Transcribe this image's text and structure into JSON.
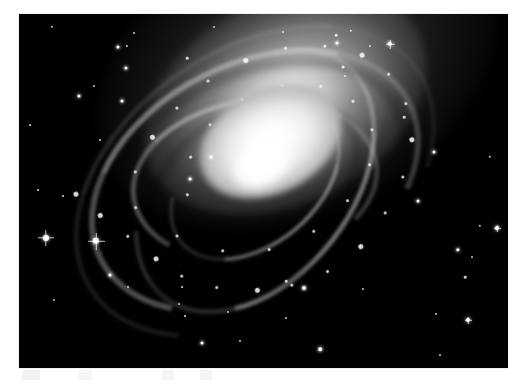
{
  "figure": {
    "kind": "astronomical-photograph",
    "color_mode": "grayscale",
    "caption": "",
    "page_background": "#ffffff",
    "plate_background": "#000000",
    "border_color": "#f2f2f2",
    "plate": {
      "x": 19,
      "y": 14,
      "width": 489,
      "height": 354
    }
  },
  "galaxy": {
    "name": "",
    "center": {
      "x": 255,
      "y": 181
    },
    "position_angle_deg": -27,
    "core_color": "#ffffff",
    "halo_color": "#9a9a9a",
    "arm_count": 4,
    "knots": [
      {
        "x": 62,
        "y": 88,
        "size": "big"
      },
      {
        "x": 74,
        "y": 118,
        "size": "big"
      },
      {
        "x": 90,
        "y": 150,
        "size": "small"
      },
      {
        "x": 104,
        "y": 182,
        "size": "big"
      },
      {
        "x": 120,
        "y": 210,
        "size": "small"
      },
      {
        "x": 146,
        "y": 236,
        "size": "small"
      },
      {
        "x": 180,
        "y": 256,
        "size": "big"
      },
      {
        "x": 214,
        "y": 268,
        "size": "small"
      },
      {
        "x": 252,
        "y": 272,
        "size": "small"
      },
      {
        "x": 292,
        "y": 264,
        "size": "big"
      },
      {
        "x": 330,
        "y": 246,
        "size": "small"
      },
      {
        "x": 362,
        "y": 222,
        "size": "small"
      },
      {
        "x": 386,
        "y": 192,
        "size": "big"
      },
      {
        "x": 398,
        "y": 158,
        "size": "small"
      },
      {
        "x": 396,
        "y": 124,
        "size": "small"
      },
      {
        "x": 380,
        "y": 94,
        "size": "big"
      },
      {
        "x": 352,
        "y": 70,
        "size": "small"
      },
      {
        "x": 316,
        "y": 54,
        "size": "small"
      },
      {
        "x": 274,
        "y": 46,
        "size": "big"
      },
      {
        "x": 232,
        "y": 48,
        "size": "small"
      },
      {
        "x": 192,
        "y": 58,
        "size": "small"
      },
      {
        "x": 156,
        "y": 72,
        "size": "big"
      },
      {
        "x": 126,
        "y": 96,
        "size": "small"
      },
      {
        "x": 110,
        "y": 128,
        "size": "small"
      },
      {
        "x": 134,
        "y": 172,
        "size": "small"
      },
      {
        "x": 168,
        "y": 206,
        "size": "small"
      },
      {
        "x": 210,
        "y": 226,
        "size": "small"
      },
      {
        "x": 258,
        "y": 230,
        "size": "small"
      },
      {
        "x": 302,
        "y": 218,
        "size": "small"
      },
      {
        "x": 338,
        "y": 196,
        "size": "small"
      },
      {
        "x": 356,
        "y": 166,
        "size": "small"
      },
      {
        "x": 352,
        "y": 132,
        "size": "small"
      },
      {
        "x": 330,
        "y": 104,
        "size": "small"
      },
      {
        "x": 296,
        "y": 86,
        "size": "small"
      },
      {
        "x": 254,
        "y": 80,
        "size": "small"
      },
      {
        "x": 214,
        "y": 88,
        "size": "small"
      },
      {
        "x": 182,
        "y": 108,
        "size": "small"
      },
      {
        "x": 162,
        "y": 140,
        "size": "small"
      }
    ]
  },
  "field_stars": [
    {
      "x": 52,
      "y": 27,
      "r": 1.2,
      "bright": false,
      "spike": 0
    },
    {
      "x": 134,
      "y": 33,
      "r": 1.0,
      "bright": false,
      "spike": 0
    },
    {
      "x": 118,
      "y": 47,
      "r": 1.6,
      "bright": true,
      "spike": 0
    },
    {
      "x": 127,
      "y": 46,
      "r": 1.1,
      "bright": false,
      "spike": 0
    },
    {
      "x": 126,
      "y": 68,
      "r": 1.6,
      "bright": true,
      "spike": 0
    },
    {
      "x": 94,
      "y": 86,
      "r": 1.1,
      "bright": false,
      "spike": 0
    },
    {
      "x": 79,
      "y": 96,
      "r": 1.5,
      "bright": true,
      "spike": 0
    },
    {
      "x": 122,
      "y": 101,
      "r": 1.5,
      "bright": true,
      "spike": 0
    },
    {
      "x": 187,
      "y": 58,
      "r": 1.3,
      "bright": false,
      "spike": 0
    },
    {
      "x": 214,
      "y": 27,
      "r": 1.0,
      "bright": false,
      "spike": 0
    },
    {
      "x": 283,
      "y": 32,
      "r": 1.1,
      "bright": false,
      "spike": 0
    },
    {
      "x": 336,
      "y": 35,
      "r": 1.3,
      "bright": false,
      "spike": 0
    },
    {
      "x": 351,
      "y": 31,
      "r": 1.2,
      "bright": false,
      "spike": 0
    },
    {
      "x": 337,
      "y": 43,
      "r": 1.6,
      "bright": true,
      "spike": 0
    },
    {
      "x": 370,
      "y": 46,
      "r": 1.1,
      "bright": false,
      "spike": 0
    },
    {
      "x": 390,
      "y": 44,
      "r": 2.2,
      "bright": true,
      "spike": 9
    },
    {
      "x": 343,
      "y": 67,
      "r": 1.4,
      "bright": false,
      "spike": 0
    },
    {
      "x": 345,
      "y": 76,
      "r": 1.0,
      "bright": false,
      "spike": 0
    },
    {
      "x": 100,
      "y": 140,
      "r": 1.0,
      "bright": false,
      "spike": 0
    },
    {
      "x": 434,
      "y": 152,
      "r": 1.5,
      "bright": true,
      "spike": 0
    },
    {
      "x": 490,
      "y": 157,
      "r": 1.2,
      "bright": false,
      "spike": 0
    },
    {
      "x": 480,
      "y": 226,
      "r": 1.2,
      "bright": false,
      "spike": 0
    },
    {
      "x": 497,
      "y": 228,
      "r": 1.9,
      "bright": true,
      "spike": 7
    },
    {
      "x": 458,
      "y": 250,
      "r": 1.7,
      "bright": true,
      "spike": 0
    },
    {
      "x": 472,
      "y": 257,
      "r": 1.0,
      "bright": false,
      "spike": 0
    },
    {
      "x": 465,
      "y": 277,
      "r": 1.3,
      "bright": false,
      "spike": 0
    },
    {
      "x": 46,
      "y": 238,
      "r": 3.0,
      "bright": true,
      "spike": 16
    },
    {
      "x": 96,
      "y": 241,
      "r": 3.2,
      "bright": true,
      "spike": 17
    },
    {
      "x": 110,
      "y": 275,
      "r": 1.5,
      "bright": true,
      "spike": 0
    },
    {
      "x": 54,
      "y": 300,
      "r": 1.1,
      "bright": false,
      "spike": 0
    },
    {
      "x": 128,
      "y": 287,
      "r": 1.0,
      "bright": false,
      "spike": 0
    },
    {
      "x": 179,
      "y": 304,
      "r": 1.0,
      "bright": false,
      "spike": 0
    },
    {
      "x": 185,
      "y": 316,
      "r": 0.9,
      "bright": false,
      "spike": 0
    },
    {
      "x": 228,
      "y": 312,
      "r": 1.1,
      "bright": false,
      "spike": 0
    },
    {
      "x": 182,
      "y": 287,
      "r": 0.9,
      "bright": false,
      "spike": 0
    },
    {
      "x": 240,
      "y": 341,
      "r": 1.0,
      "bright": false,
      "spike": 0
    },
    {
      "x": 202,
      "y": 343,
      "r": 1.5,
      "bright": true,
      "spike": 0
    },
    {
      "x": 320,
      "y": 349,
      "r": 1.8,
      "bright": true,
      "spike": 0
    },
    {
      "x": 286,
      "y": 318,
      "r": 1.1,
      "bright": false,
      "spike": 0
    },
    {
      "x": 363,
      "y": 289,
      "r": 1.0,
      "bright": false,
      "spike": 0
    },
    {
      "x": 436,
      "y": 314,
      "r": 1.0,
      "bright": false,
      "spike": 0
    },
    {
      "x": 468,
      "y": 320,
      "r": 2.0,
      "bright": true,
      "spike": 7
    },
    {
      "x": 440,
      "y": 355,
      "r": 1.0,
      "bright": false,
      "spike": 0
    },
    {
      "x": 38,
      "y": 190,
      "r": 0.9,
      "bright": false,
      "spike": 0
    },
    {
      "x": 30,
      "y": 125,
      "r": 0.9,
      "bright": false,
      "spike": 0
    },
    {
      "x": 63,
      "y": 196,
      "r": 0.9,
      "bright": false,
      "spike": 0
    },
    {
      "x": 248,
      "y": 160,
      "r": 1.8,
      "bright": true,
      "spike": 0
    },
    {
      "x": 211,
      "y": 157,
      "r": 1.6,
      "bright": true,
      "spike": 0
    },
    {
      "x": 190,
      "y": 179,
      "r": 1.4,
      "bright": true,
      "spike": 0
    },
    {
      "x": 304,
      "y": 288,
      "r": 2.0,
      "bright": true,
      "spike": 0
    },
    {
      "x": 286,
      "y": 281,
      "r": 1.3,
      "bright": false,
      "spike": 0
    },
    {
      "x": 418,
      "y": 201,
      "r": 1.5,
      "bright": true,
      "spike": 0
    },
    {
      "x": 404,
      "y": 117,
      "r": 1.3,
      "bright": false,
      "spike": 0
    }
  ]
}
